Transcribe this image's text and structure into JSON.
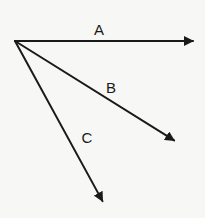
{
  "diagram": {
    "type": "vector-diagram",
    "background": "#f7f7f5",
    "stroke_color": "#1a1a1a",
    "origin": {
      "x": 15,
      "y": 41
    },
    "vectors": [
      {
        "label": "A",
        "tip": {
          "x": 194,
          "y": 41
        },
        "label_pos": {
          "x": 99,
          "y": 29
        }
      },
      {
        "label": "B",
        "tip": {
          "x": 175,
          "y": 141
        },
        "label_pos": {
          "x": 111,
          "y": 87
        }
      },
      {
        "label": "C",
        "tip": {
          "x": 103,
          "y": 202
        },
        "label_pos": {
          "x": 87,
          "y": 137
        }
      }
    ]
  }
}
